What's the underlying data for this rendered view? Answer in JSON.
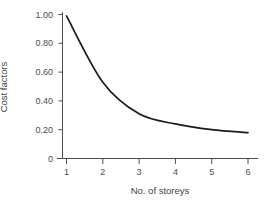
{
  "chart_data": {
    "type": "line",
    "title": "",
    "xlabel": "No. of storeys",
    "ylabel": "Cost factors",
    "x": [
      1,
      2,
      3,
      4,
      5,
      6
    ],
    "values": [
      0.99,
      0.53,
      0.31,
      0.24,
      0.2,
      0.18
    ],
    "series": [
      {
        "name": "Cost factors",
        "color": "#1a1a1a",
        "values": [
          0.99,
          0.53,
          0.31,
          0.24,
          0.2,
          0.18
        ]
      }
    ],
    "xlim": [
      0.8,
      6.4
    ],
    "ylim": [
      0,
      1.0
    ],
    "xticks": [
      1,
      2,
      3,
      4,
      5,
      6
    ],
    "xtick_labels": [
      "1",
      "2",
      "3",
      "4",
      "5",
      "6"
    ],
    "yticks": [
      0,
      0.2,
      0.4,
      0.6,
      0.8,
      1.0
    ],
    "ytick_labels": [
      "0",
      "0.20",
      "0.40",
      "0.60",
      "0.80",
      "1.00"
    ],
    "grid": false,
    "legend": null,
    "annotations": [],
    "axis_color": "#4c4c4c",
    "line_color": "#1a1a1a",
    "background": "#ffffff"
  }
}
